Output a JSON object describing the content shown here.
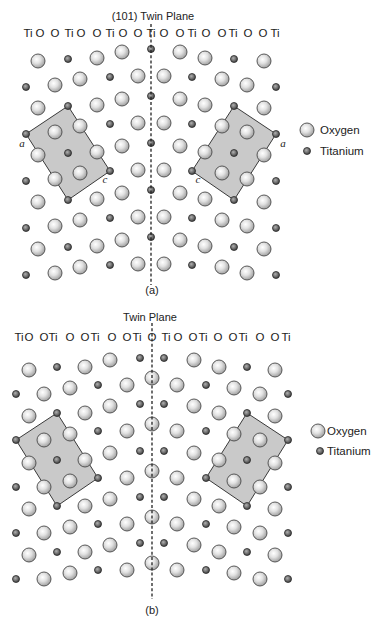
{
  "figure": {
    "panels": [
      {
        "id": "a",
        "title": "(101) Twin Plane",
        "caption": "(a)",
        "twin_plane": {
          "x": 151,
          "y1": 24,
          "y2": 285,
          "atom_on_plane": "Ti"
        },
        "column_labels": {
          "y": 37,
          "items": [
            {
              "text": "Ti",
              "x": 28
            },
            {
              "text": "O",
              "x": 40
            },
            {
              "text": "O",
              "x": 55
            },
            {
              "text": "Ti",
              "x": 69
            },
            {
              "text": "O",
              "x": 81
            },
            {
              "text": "O",
              "x": 97
            },
            {
              "text": "Ti",
              "x": 110
            },
            {
              "text": "O",
              "x": 123
            },
            {
              "text": "O",
              "x": 138
            },
            {
              "text": "Ti",
              "x": 151
            },
            {
              "text": "O",
              "x": 164
            },
            {
              "text": "O",
              "x": 180
            },
            {
              "text": "Ti",
              "x": 192
            },
            {
              "text": "O",
              "x": 206
            },
            {
              "text": "O",
              "x": 222
            },
            {
              "text": "Ti",
              "x": 233
            },
            {
              "text": "O",
              "x": 248
            },
            {
              "text": "O",
              "x": 263
            },
            {
              "text": "Ti",
              "x": 275
            }
          ]
        },
        "lattice": {
          "mirror_x": 151,
          "period_y0": [
            49,
            96,
            143,
            190,
            237
          ],
          "motif": [
            {
              "el": "Ti",
              "x": 151,
              "dy": 0,
              "on_plane": true
            },
            {
              "el": "O",
              "x": 122,
              "dy": 3
            },
            {
              "el": "O",
              "x": 97,
              "dy": 9
            },
            {
              "el": "Ti",
              "x": 68,
              "dy": 10
            },
            {
              "el": "O",
              "x": 38,
              "dy": 12
            },
            {
              "el": "O",
              "x": 138,
              "dy": 27
            },
            {
              "el": "Ti",
              "x": 110,
              "dy": 28
            },
            {
              "el": "O",
              "x": 80,
              "dy": 30
            },
            {
              "el": "O",
              "x": 55,
              "dy": 36
            },
            {
              "el": "Ti",
              "x": 26,
              "dy": 38
            }
          ]
        },
        "unit_cells": [
          {
            "side": "left",
            "points": [
              [
                68,
                106
              ],
              [
                26,
                134
              ],
              [
                68,
                200
              ],
              [
                110,
                171
              ]
            ],
            "labels": [
              {
                "text": "a",
                "x": 22,
                "y": 147
              },
              {
                "text": "c",
                "x": 105,
                "y": 183
              }
            ]
          },
          {
            "side": "right",
            "points": [
              [
                234,
                106
              ],
              [
                276,
                134
              ],
              [
                234,
                200
              ],
              [
                192,
                171
              ]
            ],
            "labels": [
              {
                "text": "a",
                "x": 283,
                "y": 147
              },
              {
                "text": "c",
                "x": 198,
                "y": 183
              }
            ]
          }
        ],
        "legend": {
          "items": [
            {
              "species": "O",
              "label": "Oxygen",
              "cx": 307,
              "cy": 130,
              "tx": 320
            },
            {
              "species": "Ti",
              "label": "Titanium",
              "cx": 307,
              "cy": 151,
              "tx": 320
            }
          ]
        }
      },
      {
        "id": "b",
        "title": "Twin Plane",
        "caption": "(b)",
        "twin_plane": {
          "x": 152,
          "y1": 323,
          "y2": 599,
          "atom_on_plane": "O"
        },
        "column_labels": {
          "y": 341,
          "items": [
            {
              "text": "Ti",
              "x": 19
            },
            {
              "text": "O",
              "x": 29
            },
            {
              "text": "O",
              "x": 44
            },
            {
              "text": "Ti",
              "x": 53
            },
            {
              "text": "O",
              "x": 70
            },
            {
              "text": "O",
              "x": 85
            },
            {
              "text": "Ti",
              "x": 95
            },
            {
              "text": "O",
              "x": 112
            },
            {
              "text": "O",
              "x": 127
            },
            {
              "text": "Ti",
              "x": 137
            },
            {
              "text": "O",
              "x": 152
            },
            {
              "text": "Ti",
              "x": 166
            },
            {
              "text": "O",
              "x": 178
            },
            {
              "text": "O",
              "x": 193
            },
            {
              "text": "Ti",
              "x": 203
            },
            {
              "text": "O",
              "x": 218
            },
            {
              "text": "O",
              "x": 233
            },
            {
              "text": "Ti",
              "x": 243
            },
            {
              "text": "O",
              "x": 260
            },
            {
              "text": "O",
              "x": 275
            },
            {
              "text": "Ti",
              "x": 286
            }
          ]
        },
        "lattice": {
          "mirror_x": 152,
          "period_y0": [
            378,
            424,
            471,
            517,
            563
          ],
          "motif": [
            {
              "el": "O",
              "x": 152,
              "dy": 0,
              "on_plane": true
            },
            {
              "el": "O",
              "x": 110,
              "dy": -18
            },
            {
              "el": "Ti",
              "x": 140,
              "dy": -20
            },
            {
              "el": "O",
              "x": 29,
              "dy": -8
            },
            {
              "el": "Ti",
              "x": 57,
              "dy": -11
            },
            {
              "el": "O",
              "x": 85,
              "dy": -11
            },
            {
              "el": "Ti",
              "x": 98,
              "dy": 7
            },
            {
              "el": "O",
              "x": 127,
              "dy": 7
            },
            {
              "el": "O",
              "x": 70,
              "dy": 10
            },
            {
              "el": "Ti",
              "x": 16,
              "dy": 16
            },
            {
              "el": "O",
              "x": 44,
              "dy": 16
            }
          ]
        },
        "unit_cells": [
          {
            "side": "left",
            "points": [
              [
                57,
                413
              ],
              [
                16,
                440
              ],
              [
                57,
                506
              ],
              [
                98,
                478
              ]
            ],
            "labels": []
          },
          {
            "side": "right",
            "points": [
              [
                247,
                413
              ],
              [
                288,
                440
              ],
              [
                247,
                506
              ],
              [
                206,
                478
              ]
            ],
            "labels": []
          }
        ],
        "legend": {
          "items": [
            {
              "species": "O",
              "label": "Oxygen",
              "cx": 318,
              "cy": 431,
              "tx": 327
            },
            {
              "species": "Ti",
              "label": "Titanium",
              "cx": 320,
              "cy": 451,
              "tx": 327
            }
          ]
        }
      }
    ]
  },
  "atom_style": {
    "O": {
      "radius": 7,
      "icon": "oxygen-atom"
    },
    "Ti": {
      "radius": 3.5,
      "icon": "titanium-atom"
    }
  },
  "colors": {
    "unit_cell_fill": "#c9c9c9",
    "unit_cell_stroke": "#3a3a3a",
    "oxygen_light": "#ffffff",
    "oxygen_dark": "#9c9c9c",
    "titanium_light": "#a0a0a0",
    "titanium_dark": "#3c3c3c"
  }
}
